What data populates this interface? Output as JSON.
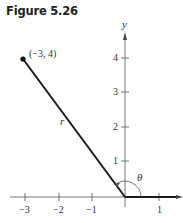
{
  "figure_title": "Figure 5.26",
  "axes": {
    "x_ticks": [
      "−3",
      "−2",
      "−1",
      "1"
    ],
    "y_ticks": [
      "1",
      "2",
      "3",
      "4"
    ],
    "y_label": "y"
  },
  "point": {
    "label": "(−3, 4)",
    "x": -3,
    "y": 4
  },
  "segment_label": "r",
  "angle_label": "θ",
  "colors": {
    "ink": "#222222",
    "axis": "#555555"
  }
}
